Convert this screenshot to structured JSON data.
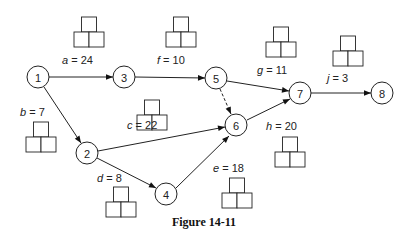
{
  "caption": "Figure 14-11",
  "nodes": [
    {
      "id": "1",
      "x": 38,
      "y": 77
    },
    {
      "id": "2",
      "x": 87,
      "y": 153
    },
    {
      "id": "3",
      "x": 124,
      "y": 77
    },
    {
      "id": "4",
      "x": 166,
      "y": 194
    },
    {
      "id": "5",
      "x": 216,
      "y": 78
    },
    {
      "id": "6",
      "x": 236,
      "y": 125
    },
    {
      "id": "7",
      "x": 300,
      "y": 93
    },
    {
      "id": "8",
      "x": 382,
      "y": 93
    }
  ],
  "activities": [
    {
      "name": "a",
      "duration": "24",
      "from": "1",
      "to": "3",
      "label_x": 62,
      "label_y": 64,
      "box_x": 74,
      "box_y": 17
    },
    {
      "name": "b",
      "duration": "7",
      "from": "1",
      "to": "2",
      "label_x": 20,
      "label_y": 116,
      "box_x": 26,
      "box_y": 122
    },
    {
      "name": "c",
      "duration": "22",
      "from": "2",
      "to": "6",
      "label_x": 127,
      "label_y": 129,
      "box_x": 137,
      "box_y": 100
    },
    {
      "name": "d",
      "duration": "8",
      "from": "2",
      "to": "4",
      "label_x": 97,
      "label_y": 182,
      "box_x": 106,
      "box_y": 187
    },
    {
      "name": "e",
      "duration": "18",
      "from": "4",
      "to": "6",
      "label_x": 213,
      "label_y": 172,
      "box_x": 222,
      "box_y": 178
    },
    {
      "name": "f",
      "duration": "10",
      "from": "3",
      "to": "5",
      "label_x": 157,
      "label_y": 64,
      "box_x": 166,
      "box_y": 17
    },
    {
      "name": "g",
      "duration": "11",
      "from": "5",
      "to": "7",
      "label_x": 257,
      "label_y": 74,
      "box_x": 266,
      "box_y": 27
    },
    {
      "name": "h",
      "duration": "20",
      "from": "6",
      "to": "7",
      "label_x": 266,
      "label_y": 130,
      "box_x": 275,
      "box_y": 137
    },
    {
      "name": "j",
      "duration": "3",
      "from": "7",
      "to": "8",
      "label_x": 327,
      "label_y": 82,
      "box_x": 333,
      "box_y": 36
    }
  ],
  "dummy_activities": [
    {
      "from": "5",
      "to": "6",
      "style": "dashed"
    }
  ],
  "edges": [
    {
      "from": "1",
      "to": "3",
      "x1": 49,
      "y1": 77,
      "x2": 113,
      "y2": 77
    },
    {
      "from": "1",
      "to": "2",
      "x1": 44,
      "y1": 87,
      "x2": 81,
      "y2": 143
    },
    {
      "from": "3",
      "to": "5",
      "x1": 135,
      "y1": 77,
      "x2": 205,
      "y2": 78
    },
    {
      "from": "2",
      "to": "6",
      "x1": 98,
      "y1": 151,
      "x2": 225,
      "y2": 127
    },
    {
      "from": "2",
      "to": "4",
      "x1": 97,
      "y1": 158,
      "x2": 156,
      "y2": 188
    },
    {
      "from": "4",
      "to": "6",
      "x1": 176,
      "y1": 188,
      "x2": 229,
      "y2": 136
    },
    {
      "from": "5",
      "to": "6",
      "x1": 220,
      "y1": 89,
      "x2": 231,
      "y2": 114,
      "dashed": true
    },
    {
      "from": "5",
      "to": "7",
      "x1": 227,
      "y1": 81,
      "x2": 289,
      "y2": 91
    },
    {
      "from": "6",
      "to": "7",
      "x1": 247,
      "y1": 120,
      "x2": 290,
      "y2": 99
    },
    {
      "from": "7",
      "to": "8",
      "x1": 311,
      "y1": 93,
      "x2": 371,
      "y2": 93
    }
  ]
}
